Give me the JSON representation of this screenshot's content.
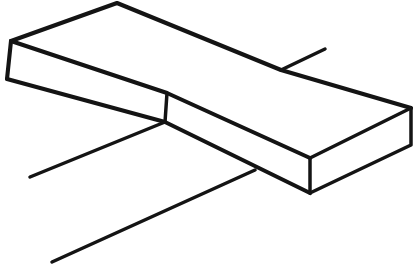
{
  "document": {
    "kind": "line-drawing",
    "title": "Isometric rectangular slab line drawing",
    "description": "Freehand black-ink outline of a long flat rectangular block (plank) drawn in oblique/isometric projection, with three straight stray lines radiating outward from the block.",
    "alt_text": "Hand-drawn outline of a flat rectangular slab seen from above at an angle, with three loose straight lines crossing it.",
    "width": 419,
    "height": 273
  },
  "canvas": {
    "width": 419,
    "height": 273,
    "background_color": "#ffffff",
    "ink_color": "#141414"
  },
  "style": {
    "stroke_color": "#141414",
    "fill_color": "#ffffff",
    "stroke_width_thick": 4.1,
    "stroke_width_medium": 3.5,
    "stroke_width_thin": 3.1,
    "line_cap": "round",
    "line_join": "round"
  },
  "vertices": {
    "back_left_top": [
      11,
      41
    ],
    "back_peak": [
      117,
      3
    ],
    "back_kink": [
      281,
      70
    ],
    "back_right_top": [
      411,
      108
    ],
    "right_bottom": [
      411,
      145
    ],
    "front_right_top": [
      310,
      158
    ],
    "front_right_bottom": [
      310,
      193
    ],
    "mid_break_top": [
      167,
      93
    ],
    "mid_break_bottom": [
      165,
      122
    ],
    "front_left_bottom": [
      7,
      79
    ]
  },
  "shapes": {
    "slab": {
      "name": "rectangular-slab",
      "top_face_path": "M 11 41 L 117 3 L 281 70 L 411 108 L 310 158 L 167 93 Z",
      "right_end_face_path": "M 411 108 L 411 145 L 310 193 L 310 158 Z",
      "front_face_left_path": "M 11 41 L 167 93 L 165 122 L 7 79 Z",
      "front_face_right_path": "M 167 93 L 310 158 L 310 193 L 165 122 Z",
      "edges": [
        {
          "name": "top-back-edge-left",
          "from": [
            11,
            41
          ],
          "to": [
            117,
            3
          ],
          "weight": "thick"
        },
        {
          "name": "top-back-edge-right",
          "from": [
            117,
            3
          ],
          "to": [
            281,
            70
          ],
          "weight": "thick"
        },
        {
          "name": "top-back-edge-far",
          "from": [
            281,
            70
          ],
          "to": [
            411,
            108
          ],
          "weight": "thick"
        },
        {
          "name": "right-end-top-edge",
          "from": [
            411,
            108
          ],
          "to": [
            310,
            158
          ],
          "weight": "med"
        },
        {
          "name": "right-end-vertical-edge",
          "from": [
            411,
            108
          ],
          "to": [
            411,
            145
          ],
          "weight": "med"
        },
        {
          "name": "right-end-bottom-edge",
          "from": [
            411,
            145
          ],
          "to": [
            310,
            193
          ],
          "weight": "med"
        },
        {
          "name": "front-corner-vertical-edge",
          "from": [
            310,
            158
          ],
          "to": [
            310,
            193
          ],
          "weight": "med"
        },
        {
          "name": "top-front-edge-right",
          "from": [
            310,
            158
          ],
          "to": [
            167,
            93
          ],
          "weight": "med"
        },
        {
          "name": "top-front-edge-left",
          "from": [
            167,
            93
          ],
          "to": [
            11,
            41
          ],
          "weight": "thick"
        },
        {
          "name": "left-end-vertical-edge",
          "from": [
            11,
            41
          ],
          "to": [
            7,
            79
          ],
          "weight": "thick"
        },
        {
          "name": "front-bottom-edge-left",
          "from": [
            7,
            79
          ],
          "to": [
            165,
            122
          ],
          "weight": "thick"
        },
        {
          "name": "front-bottom-edge-right",
          "from": [
            165,
            122
          ],
          "to": [
            310,
            193
          ],
          "weight": "med"
        },
        {
          "name": "mid-break-vertical-edge",
          "from": [
            167,
            93
          ],
          "to": [
            165,
            122
          ],
          "weight": "med"
        }
      ]
    },
    "stray_lines": [
      {
        "name": "stray-line-upper-right",
        "from": [
          281,
          70
        ],
        "to": [
          325,
          49
        ],
        "weight": "med"
      },
      {
        "name": "stray-line-middle-left",
        "from": [
          165,
          122
        ],
        "to": [
          30,
          177
        ],
        "weight": "med"
      },
      {
        "name": "stray-line-lower-left",
        "from": [
          255,
          170
        ],
        "to": [
          52,
          262
        ],
        "weight": "med"
      }
    ]
  },
  "labels": {
    "figure_caption": "",
    "annotations": []
  }
}
